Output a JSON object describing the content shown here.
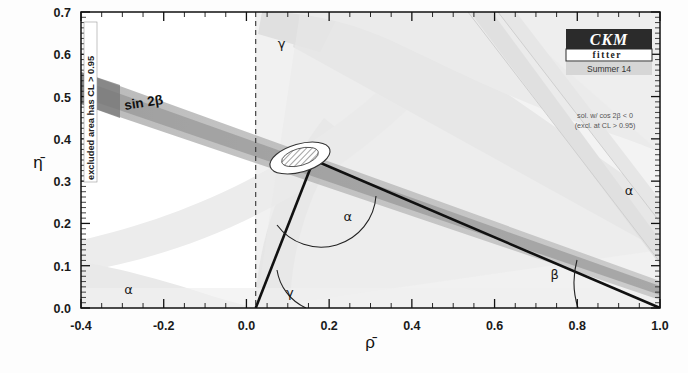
{
  "figure": {
    "logo": {
      "main_text": "CKM",
      "sub_text": "fitter",
      "season_text": "Summer 14",
      "box_color": "#2b2b2b",
      "season_bg": "#cfcfcf"
    },
    "notes": {
      "excluded_label": "excluded area has CL > 0.95",
      "cos2beta_line1": "sol. w/ cos 2β < 0",
      "cos2beta_line2": "(excl. at CL > 0.95)"
    }
  },
  "chart_data": {
    "type": "scatter",
    "title": "",
    "xlabel": "ρ̄",
    "ylabel": "η̄",
    "xlim": [
      -0.4,
      1.0
    ],
    "ylim": [
      0.0,
      0.7
    ],
    "xticks": [
      "-0.4",
      "-0.2",
      "0.0",
      "0.2",
      "0.4",
      "0.6",
      "0.8",
      "1.0"
    ],
    "xtick_values": [
      -0.4,
      -0.2,
      0.0,
      0.2,
      0.4,
      0.6,
      0.8,
      1.0
    ],
    "yticks": [
      "0.0",
      "0.1",
      "0.2",
      "0.3",
      "0.4",
      "0.5",
      "0.6",
      "0.7"
    ],
    "ytick_values": [
      0.0,
      0.1,
      0.2,
      0.3,
      0.4,
      0.5,
      0.6,
      0.7
    ],
    "minor_tick_step": 0.05,
    "grid": false,
    "legend_position": "none",
    "triangle": {
      "apex": [
        0.14,
        0.35
      ],
      "left_vertex": [
        0.0,
        0.0
      ],
      "right_vertex": [
        1.0,
        0.0
      ],
      "apex_label": "apex of unitarity triangle"
    },
    "angle_labels": [
      {
        "name": "alpha-apex",
        "symbol": "α",
        "x": 0.245,
        "y": 0.205
      },
      {
        "name": "gamma-origin",
        "symbol": "γ",
        "x": 0.105,
        "y": 0.025
      },
      {
        "name": "beta-right",
        "symbol": "β",
        "x": 0.745,
        "y": 0.068
      },
      {
        "name": "gamma-band",
        "symbol": "γ",
        "x": 0.085,
        "y": 0.615
      },
      {
        "name": "alpha-left-band",
        "symbol": "α",
        "x": -0.285,
        "y": 0.032
      },
      {
        "name": "alpha-right-band",
        "symbol": "α",
        "x": 0.925,
        "y": 0.268
      }
    ],
    "constraint_bands": [
      {
        "name": "sin2beta",
        "label": "sin 2β",
        "label_x": -0.165,
        "label_y": 0.505,
        "color": "#9a9a9a"
      },
      {
        "name": "gamma-wedge",
        "label": "γ",
        "color": "#d8d8d8"
      },
      {
        "name": "alpha-wedge",
        "label": "α",
        "color": "#dcdcdc"
      },
      {
        "name": "vub-arc",
        "label": "|Vub|",
        "color": "#e3e3e3"
      },
      {
        "name": "epsilonK",
        "label": "εK",
        "color": "#ededed"
      },
      {
        "name": "deltamd-deltams",
        "label": "Δmd & Δms",
        "color": "#e8e8e8"
      }
    ]
  }
}
